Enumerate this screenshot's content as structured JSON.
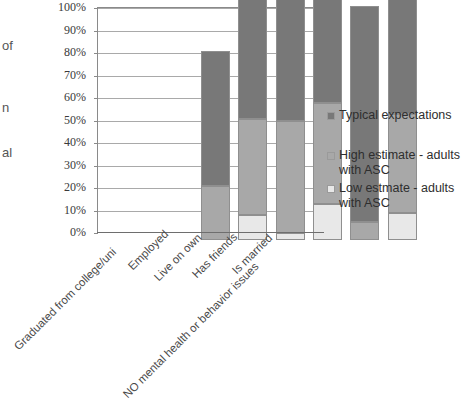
{
  "chart_data": {
    "type": "bar",
    "subtype": "stacked-vertical",
    "title": "",
    "xlabel": "",
    "ylabel": "",
    "ylim": [
      0,
      100
    ],
    "y_unit": "%",
    "grid": true,
    "legend_position": "right",
    "categories": [
      "Graduated from college/uni",
      "Employed",
      "Live on own",
      "Has friends",
      "Is married",
      "NO mental health or behavior issues"
    ],
    "y_tick_labels": [
      "0%",
      "10%",
      "20%",
      "30%",
      "40%",
      "50%",
      "60%",
      "70%",
      "80%",
      "90%",
      "100%"
    ],
    "y_tick_values": [
      0,
      10,
      20,
      30,
      40,
      50,
      60,
      70,
      80,
      90,
      100
    ],
    "series": [
      {
        "name": "Low estmate - adults with ASC",
        "color": "#e8e8e8",
        "values": [
          0,
          11,
          3,
          16,
          0,
          12
        ]
      },
      {
        "name": "High estimate - adults with ASC",
        "color": "#a8a8a8",
        "values": [
          24,
          43,
          50,
          45,
          8,
          44
        ]
      },
      {
        "name": "Typical expectations",
        "color": "#787878",
        "values": [
          60,
          95,
          96,
          75,
          96,
          75
        ]
      }
    ],
    "legend_entries": [
      {
        "label": "Typical expectations",
        "color": "#787878"
      },
      {
        "label": "High estimate - adults with ASC",
        "color": "#a8a8a8"
      },
      {
        "label": "Low estmate - adults with ASC",
        "color": "#e8e8e8"
      }
    ]
  },
  "left_fragments": [
    {
      "text": "of",
      "top": 38
    },
    {
      "text": "n",
      "top": 100
    },
    {
      "text": "al",
      "top": 145
    }
  ],
  "colors": {
    "typical": "#787878",
    "high_estimate": "#a8a8a8",
    "low_estimate": "#e8e8e8",
    "gridline": "#a9a9a9",
    "axis": "#8a8a8a",
    "background": "#ffffff"
  }
}
